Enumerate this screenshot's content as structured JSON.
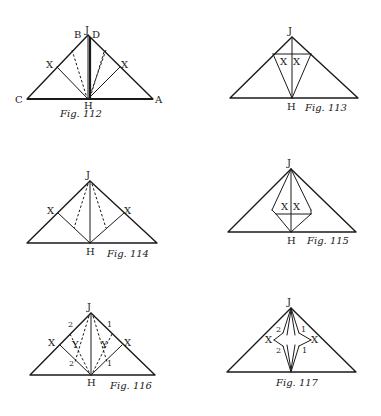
{
  "figures": [
    {
      "id": "fig112",
      "caption": "Fig. 112",
      "caption_pos": [
        60,
        117
      ],
      "triangle": [
        [
          88,
          35
        ],
        [
          27,
          99
        ],
        [
          153,
          99
        ]
      ],
      "solid": [
        [
          [
            88,
            35
          ],
          [
            88,
            99
          ]
        ],
        [
          [
            57,
            67
          ],
          [
            88,
            99
          ]
        ],
        [
          [
            120,
            67
          ],
          [
            88,
            99
          ]
        ]
      ],
      "heavy": [
        [
          [
            27,
            99
          ],
          [
            153,
            99
          ]
        ],
        [
          [
            90,
            37
          ],
          [
            90,
            99
          ]
        ]
      ],
      "dashed": [
        [
          [
            72,
            50
          ],
          [
            87,
            98
          ]
        ],
        [
          [
            106,
            50
          ],
          [
            89,
            98
          ]
        ],
        [
          [
            104,
            52
          ],
          [
            90,
            98
          ]
        ]
      ],
      "labels": [
        {
          "text": "J",
          "x": 85,
          "y": 33
        },
        {
          "text": "B",
          "x": 74,
          "y": 38
        },
        {
          "text": "D",
          "x": 92,
          "y": 38
        },
        {
          "text": "X",
          "x": 46,
          "y": 68
        },
        {
          "text": "X",
          "x": 121,
          "y": 68
        },
        {
          "text": "C",
          "x": 15,
          "y": 103
        },
        {
          "text": "A",
          "x": 155,
          "y": 103
        },
        {
          "text": "H",
          "x": 84,
          "y": 109
        }
      ]
    },
    {
      "id": "fig113",
      "caption": "Fig. 113",
      "caption_pos": [
        305,
        111
      ],
      "triangle": [
        [
          292,
          37
        ],
        [
          230,
          98
        ],
        [
          358,
          98
        ]
      ],
      "solid": [
        [
          [
            292,
            37
          ],
          [
            292,
            98
          ]
        ],
        [
          [
            273,
            54
          ],
          [
            311,
            54
          ]
        ],
        [
          [
            273,
            54
          ],
          [
            292,
            98
          ]
        ],
        [
          [
            311,
            54
          ],
          [
            292,
            98
          ]
        ]
      ],
      "heavy": [],
      "dashed": [],
      "labels": [
        {
          "text": "J",
          "x": 288,
          "y": 34
        },
        {
          "text": "X",
          "x": 280,
          "y": 65
        },
        {
          "text": "X",
          "x": 293,
          "y": 65
        },
        {
          "text": "H",
          "x": 287,
          "y": 110
        }
      ]
    },
    {
      "id": "fig114",
      "caption": "Fig. 114",
      "caption_pos": [
        107,
        257
      ],
      "triangle": [
        [
          90,
          181
        ],
        [
          27,
          243
        ],
        [
          157,
          243
        ]
      ],
      "solid": [
        [
          [
            90,
            181
          ],
          [
            90,
            243
          ]
        ],
        [
          [
            58,
            213
          ],
          [
            90,
            243
          ]
        ],
        [
          [
            124,
            213
          ],
          [
            90,
            243
          ]
        ]
      ],
      "heavy": [],
      "dashed": [
        [
          [
            88,
            184
          ],
          [
            74,
            228
          ]
        ],
        [
          [
            92,
            184
          ],
          [
            106,
            228
          ]
        ]
      ],
      "labels": [
        {
          "text": "J",
          "x": 86,
          "y": 178
        },
        {
          "text": "X",
          "x": 47,
          "y": 214
        },
        {
          "text": "X",
          "x": 124,
          "y": 214
        },
        {
          "text": "H",
          "x": 86,
          "y": 255
        }
      ]
    },
    {
      "id": "fig115",
      "caption": "Fig. 115",
      "caption_pos": [
        307,
        244
      ],
      "triangle": [
        [
          291,
          169
        ],
        [
          228,
          232
        ],
        [
          356,
          232
        ]
      ],
      "solid": [
        [
          [
            291,
            169
          ],
          [
            291,
            232
          ]
        ],
        [
          [
            291,
            169
          ],
          [
            272,
            210
          ]
        ],
        [
          [
            291,
            169
          ],
          [
            311,
            210
          ]
        ],
        [
          [
            272,
            210
          ],
          [
            276,
            214
          ]
        ],
        [
          [
            276,
            214
          ],
          [
            311,
            214
          ]
        ],
        [
          [
            276,
            214
          ],
          [
            291,
            232
          ]
        ],
        [
          [
            311,
            210
          ],
          [
            311,
            214
          ]
        ],
        [
          [
            311,
            214
          ],
          [
            291,
            232
          ]
        ]
      ],
      "heavy": [],
      "dashed": [],
      "labels": [
        {
          "text": "J",
          "x": 287,
          "y": 166
        },
        {
          "text": "X",
          "x": 281,
          "y": 210
        },
        {
          "text": "X",
          "x": 293,
          "y": 210
        },
        {
          "text": "H",
          "x": 287,
          "y": 244
        }
      ]
    },
    {
      "id": "fig116",
      "caption": "Fig. 116",
      "caption_pos": [
        110,
        389
      ],
      "triangle": [
        [
          91,
          313
        ],
        [
          30,
          375
        ],
        [
          155,
          375
        ]
      ],
      "solid": [
        [
          [
            91,
            313
          ],
          [
            91,
            375
          ]
        ],
        [
          [
            60,
            345
          ],
          [
            91,
            375
          ]
        ],
        [
          [
            122,
            345
          ],
          [
            91,
            375
          ]
        ]
      ],
      "heavy": [],
      "dashed": [
        [
          [
            89,
            316
          ],
          [
            75,
            362
          ]
        ],
        [
          [
            93,
            316
          ],
          [
            107,
            362
          ]
        ],
        [
          [
            70,
            334
          ],
          [
            90,
            374
          ]
        ],
        [
          [
            112,
            334
          ],
          [
            92,
            374
          ]
        ]
      ],
      "labels": [
        {
          "text": "J",
          "x": 87,
          "y": 310
        },
        {
          "text": "2",
          "x": 68,
          "y": 327,
          "small": true
        },
        {
          "text": "1",
          "x": 107,
          "y": 327,
          "small": true
        },
        {
          "text": "X",
          "x": 48,
          "y": 346
        },
        {
          "text": "X",
          "x": 124,
          "y": 346
        },
        {
          "text": "Y",
          "x": 72,
          "y": 348
        },
        {
          "text": "Y",
          "x": 101,
          "y": 348
        },
        {
          "text": "2",
          "x": 69,
          "y": 366,
          "small": true
        },
        {
          "text": "1",
          "x": 107,
          "y": 366,
          "small": true
        },
        {
          "text": "H",
          "x": 87,
          "y": 386
        }
      ]
    },
    {
      "id": "fig117",
      "caption": "Fig. 117",
      "caption_pos": [
        276,
        386
      ],
      "triangle": [
        [
          291,
          308
        ],
        [
          227,
          372
        ],
        [
          356,
          372
        ]
      ],
      "solid": [
        [
          [
            291,
            308
          ],
          [
            283,
            333
          ]
        ],
        [
          [
            283,
            333
          ],
          [
            274,
            340
          ]
        ],
        [
          [
            274,
            340
          ],
          [
            283,
            346
          ]
        ],
        [
          [
            283,
            346
          ],
          [
            291,
            372
          ]
        ],
        [
          [
            291,
            308
          ],
          [
            299,
            333
          ]
        ],
        [
          [
            299,
            333
          ],
          [
            311,
            340
          ]
        ],
        [
          [
            311,
            340
          ],
          [
            299,
            346
          ]
        ],
        [
          [
            299,
            346
          ],
          [
            291,
            372
          ]
        ],
        [
          [
            291,
            310
          ],
          [
            287,
            335
          ]
        ],
        [
          [
            291,
            310
          ],
          [
            295,
            335
          ]
        ],
        [
          [
            287,
            345
          ],
          [
            291,
            370
          ]
        ],
        [
          [
            295,
            345
          ],
          [
            291,
            370
          ]
        ]
      ],
      "heavy": [],
      "dashed": [],
      "labels": [
        {
          "text": "J",
          "x": 287,
          "y": 305
        },
        {
          "text": "2",
          "x": 276,
          "y": 332,
          "small": true
        },
        {
          "text": "1",
          "x": 301,
          "y": 332,
          "small": true
        },
        {
          "text": "X",
          "x": 265,
          "y": 343
        },
        {
          "text": "X",
          "x": 311,
          "y": 343
        },
        {
          "text": "2",
          "x": 276,
          "y": 353,
          "small": true
        },
        {
          "text": "1",
          "x": 302,
          "y": 353,
          "small": true
        }
      ]
    }
  ]
}
